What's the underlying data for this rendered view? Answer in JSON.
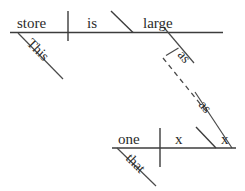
{
  "diagram": {
    "type": "reed-kellogg-sentence-diagram",
    "stroke_color": "#3c3c3c",
    "text_color": "#2b2b2b",
    "background_color": "#ffffff",
    "main_clause": {
      "subject": "store",
      "subject_modifier": "This",
      "verb": "is",
      "predicate_adjective": "large",
      "comparative_particle": "as"
    },
    "subordinate_clause": {
      "subject": "one",
      "subject_modifier": "that",
      "verb": "x",
      "complement": "x",
      "comparative_particle": "as"
    },
    "labels": {
      "store": "store",
      "this": "This",
      "is": "is",
      "large": "large",
      "as_upper": "as",
      "as_lower": "as",
      "one": "one",
      "that": "that",
      "x_verb": "x",
      "x_complement": "x"
    }
  }
}
